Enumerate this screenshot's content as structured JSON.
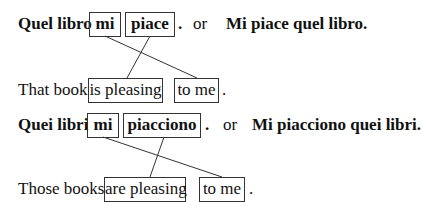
{
  "examples": [
    {
      "italian_subject": "Quel libro",
      "clitic": "mi",
      "verb": "piace",
      "period": ".",
      "or_label": "or",
      "alternative": "Mi piace quel libro.",
      "english_subject": "That book",
      "english_verb": "is pleasing",
      "english_object": "to me",
      "english_period": "."
    },
    {
      "italian_subject": "Quei libri",
      "clitic": "mi",
      "verb": "piacciono",
      "period": ".",
      "or_label": "or",
      "alternative": "Mi piacciono quei libri.",
      "english_subject": "Those books",
      "english_verb": "are pleasing",
      "english_object": "to me",
      "english_period": "."
    }
  ],
  "colors": {
    "text": "#111111",
    "border": "#333333",
    "background": "#ffffff"
  }
}
